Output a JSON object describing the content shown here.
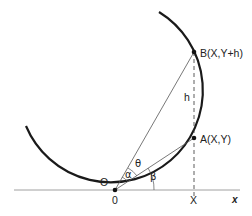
{
  "diagram": {
    "points": {
      "origin_label": "O",
      "A_label": "A(X,Y)",
      "B_label": "B(X,Y+h)"
    },
    "segment_labels": {
      "h": "h"
    },
    "angles": {
      "alpha": "α",
      "beta": "β",
      "theta": "θ"
    },
    "axis": {
      "x_label": "x",
      "tick_zero": "0",
      "tick_X": "X"
    },
    "colors": {
      "curve": "#1a1a1a",
      "axis": "#9a9a9a",
      "lines": "#555555"
    }
  }
}
